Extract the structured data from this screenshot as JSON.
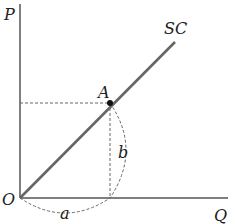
{
  "diagram": {
    "axes": {
      "y_label": "P",
      "x_label": "Q",
      "origin_label": "O"
    },
    "curve": {
      "label": "SC",
      "color": "#555555"
    },
    "point": {
      "label": "A"
    },
    "segments": {
      "horizontal_label": "a",
      "vertical_label": "b"
    },
    "colors": {
      "axis": "#555555",
      "dashed": "#666666",
      "text": "#222222"
    }
  }
}
